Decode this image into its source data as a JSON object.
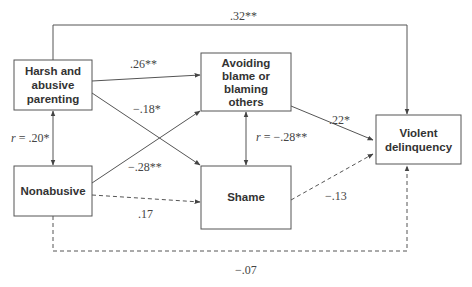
{
  "nodes": {
    "harsh": {
      "lines": [
        "Harsh and",
        "abusive",
        "parenting"
      ]
    },
    "nonabusive": {
      "lines": [
        "Nonabusive"
      ]
    },
    "avoiding": {
      "lines": [
        "Avoiding",
        "blame or",
        "blaming",
        "others"
      ]
    },
    "shame": {
      "lines": [
        "Shame"
      ]
    },
    "violent": {
      "lines": [
        "Violent",
        "delinquency"
      ]
    }
  },
  "edges": {
    "harsh_to_violent": {
      "label": ".32**",
      "style": "solid"
    },
    "harsh_to_avoiding": {
      "label": ".26**",
      "style": "solid"
    },
    "harsh_to_shame": {
      "label": "−.18*",
      "style": "solid"
    },
    "nonabusive_to_avoiding": {
      "label": "−.28**",
      "style": "solid"
    },
    "nonabusive_to_shame": {
      "label": ".17",
      "style": "dashed"
    },
    "avoiding_to_violent": {
      "label": ".22*",
      "style": "solid"
    },
    "shame_to_violent": {
      "label": "−.13",
      "style": "dashed"
    },
    "nonabusive_to_violent": {
      "label": "−.07",
      "style": "dashed"
    },
    "harsh_nonabusive_corr": {
      "r": "r",
      "label": " = .20*",
      "style": "solid-bidirectional"
    },
    "avoiding_shame_corr": {
      "r": "r",
      "label": " = −.28**",
      "style": "solid-bidirectional"
    }
  }
}
